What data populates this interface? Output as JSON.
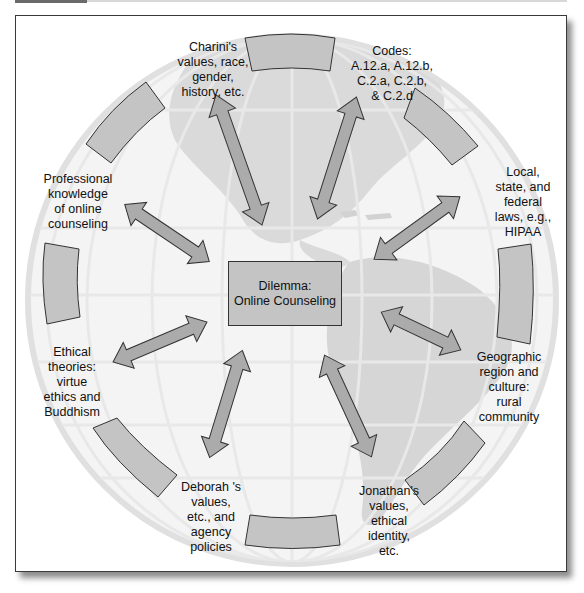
{
  "diagram": {
    "center": {
      "title": "Dilemma:",
      "subtitle": "Online Counseling"
    },
    "nodes": [
      {
        "id": "charini",
        "text": "Charini's\nvalues, race,\ngender,\nhistory, etc."
      },
      {
        "id": "codes",
        "text": "Codes:\nA.12.a, A.12.b,\nC.2.a, C.2.b,\n& C.2.d"
      },
      {
        "id": "laws",
        "text": "Local,\nstate, and\nfederal\nlaws, e.g.,\nHIPAA"
      },
      {
        "id": "geographic",
        "text": "Geographic\nregion and\nculture:\nrural\ncommunity"
      },
      {
        "id": "jonathan",
        "text": "Jonathan's\nvalues,\nethical\nidentity,\netc."
      },
      {
        "id": "deborah",
        "text": "Deborah 's\nvalues,\netc., and\nagency\npolicies"
      },
      {
        "id": "ethical",
        "text": "Ethical\ntheories:\nvirtue\nethics and\nBuddhism"
      },
      {
        "id": "professional",
        "text": "Professional\nknowledge\nof online\ncounseling"
      }
    ],
    "colors": {
      "box_fill": "#c4c4c4",
      "arrow_fill": "#ababab",
      "outline": "#333333",
      "globe_land": "#dadada",
      "globe_grid": "#e6e6e6",
      "frame_border": "#3a3a3a"
    }
  }
}
